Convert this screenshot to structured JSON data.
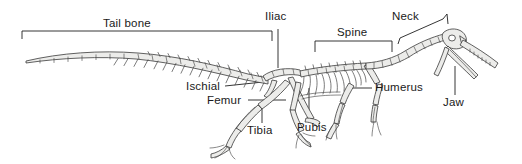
{
  "figure": {
    "type": "anatomical-diagram",
    "background_color": "#ffffff",
    "line_color": "#3a3a3a",
    "bone_fill_color": "#e9e9e7",
    "text_color": "#1a1a1a"
  },
  "labels": {
    "tail_bone": "Tail bone",
    "iliac": "Iliac",
    "spine": "Spine",
    "neck": "Neck",
    "humerus": "Humerus",
    "jaw": "Jaw",
    "ischial": "Ischial",
    "femur": "Femur",
    "tibia": "Tibia",
    "pubis": "Pubis"
  },
  "annotations": [
    {
      "name": "tail-bone",
      "label": "Tail bone",
      "connector": "bracket-horizontal"
    },
    {
      "name": "iliac",
      "label": "Iliac",
      "connector": "leader-vertical"
    },
    {
      "name": "spine",
      "label": "Spine",
      "connector": "bracket-horizontal"
    },
    {
      "name": "neck",
      "label": "Neck",
      "connector": "bracket-slanted"
    },
    {
      "name": "humerus",
      "label": "Humerus",
      "connector": "leader-horizontal"
    },
    {
      "name": "jaw",
      "label": "Jaw",
      "connector": "leader-vertical"
    },
    {
      "name": "ischial",
      "label": "Ischial",
      "connector": "leader-horizontal"
    },
    {
      "name": "femur",
      "label": "Femur",
      "connector": "leader-horizontal"
    },
    {
      "name": "tibia",
      "label": "Tibia",
      "connector": "leader-vertical"
    },
    {
      "name": "pubis",
      "label": "Pubis",
      "connector": "leader-vertical"
    }
  ]
}
